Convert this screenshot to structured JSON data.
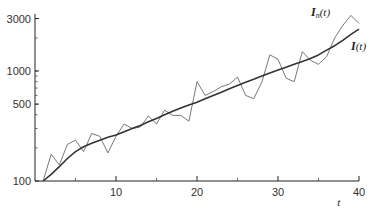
{
  "chart_data": {
    "type": "line",
    "title": "",
    "xlabel": "t",
    "ylabel": "",
    "yscale": "log",
    "xlim": [
      0,
      40
    ],
    "ylim": [
      100,
      3500
    ],
    "x_ticks": [
      10,
      20,
      30,
      40
    ],
    "x_minor_ticks": [
      5,
      15,
      25,
      35
    ],
    "y_ticks": [
      100,
      500,
      1000,
      3000
    ],
    "grid": false,
    "legend": "inline labels near right end",
    "series": [
      {
        "name": "I_n(t)",
        "label_main": "I",
        "label_sub": "n",
        "label_tail": "(t)",
        "style": "thin",
        "x": [
          1,
          2,
          3,
          4,
          5,
          6,
          7,
          8,
          9,
          10,
          11,
          12,
          13,
          14,
          15,
          16,
          17,
          18,
          19,
          20,
          21,
          22,
          23,
          24,
          25,
          26,
          27,
          28,
          29,
          30,
          31,
          32,
          33,
          34,
          35,
          36,
          37,
          38,
          39,
          40
        ],
        "values": [
          100,
          175,
          140,
          215,
          235,
          185,
          270,
          255,
          180,
          255,
          330,
          300,
          310,
          390,
          330,
          440,
          395,
          395,
          350,
          800,
          600,
          650,
          720,
          760,
          880,
          600,
          560,
          790,
          1400,
          1280,
          860,
          800,
          1500,
          1250,
          1150,
          1350,
          2000,
          2600,
          3200,
          2700
        ]
      },
      {
        "name": "I(t)",
        "label_main": "I",
        "label_sub": "",
        "label_tail": "(t)",
        "style": "thick",
        "x": [
          1,
          2,
          3,
          4,
          5,
          6,
          7,
          8,
          9,
          10,
          11,
          12,
          13,
          14,
          15,
          16,
          17,
          18,
          19,
          20,
          21,
          22,
          23,
          24,
          25,
          26,
          27,
          28,
          29,
          30,
          31,
          32,
          33,
          34,
          35,
          36,
          37,
          38,
          39,
          40
        ],
        "values": [
          100,
          115,
          135,
          160,
          185,
          205,
          220,
          235,
          250,
          262,
          280,
          300,
          320,
          345,
          370,
          400,
          430,
          460,
          490,
          520,
          560,
          600,
          640,
          690,
          740,
          790,
          840,
          900,
          960,
          1020,
          1080,
          1150,
          1220,
          1300,
          1400,
          1550,
          1700,
          1900,
          2150,
          2400
        ]
      }
    ]
  }
}
